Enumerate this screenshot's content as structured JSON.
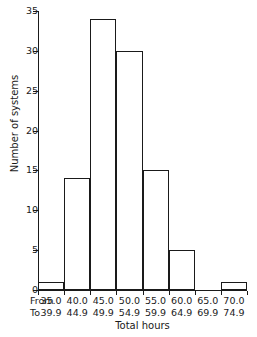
{
  "chart_data": {
    "type": "bar",
    "title": "",
    "subtitle": "",
    "xlabel": "Total hours",
    "ylabel": "Number of systems",
    "categories": [
      "35.0-39.9",
      "40.0-44.9",
      "45.0-49.9",
      "50.0-54.9",
      "55.0-59.9",
      "60.0-64.9",
      "65.0-69.9",
      "70.0-74.9"
    ],
    "bin_from": [
      "35.0",
      "40.0",
      "45.0",
      "50.0",
      "55.0",
      "60.0",
      "65.0",
      "70.0"
    ],
    "bin_to": [
      "39.9",
      "44.9",
      "49.9",
      "54.9",
      "59.9",
      "64.9",
      "69.9",
      "74.9"
    ],
    "values": [
      1,
      14,
      34,
      30,
      15,
      5,
      0,
      1
    ],
    "ylim": [
      0,
      35
    ],
    "ytick_labels": [
      "0",
      "5",
      "10",
      "15",
      "20",
      "25",
      "30",
      "35"
    ],
    "ytick_values": [
      0,
      5,
      10,
      15,
      20,
      25,
      30,
      35
    ],
    "grid": false,
    "legend": false,
    "bar_face_color": "#ffffff",
    "bar_edge_color": "#1a1a1a",
    "axis_color": "#1a1a1a",
    "background_color": "#ffffff"
  },
  "axis_row_labels": {
    "from": "From",
    "to": "To"
  }
}
